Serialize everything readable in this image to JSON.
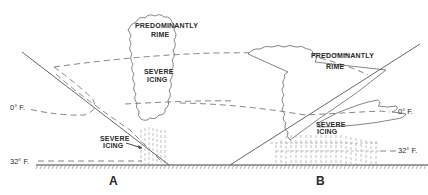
{
  "diagram": {
    "panels": [
      {
        "id": "A",
        "label": "A",
        "cloud_labels": {
          "top": [
            "PREDOMINANTLY",
            "RIME"
          ],
          "middle": [
            "SEVERE",
            "ICING"
          ]
        },
        "ground_label": [
          "SEVERE",
          "ICING"
        ],
        "isotherms": {
          "upper": "0° F.",
          "lower": "32° F."
        }
      },
      {
        "id": "B",
        "label": "B",
        "cloud_labels": {
          "top": [
            "PREDOMINANTLY",
            "RIME"
          ],
          "lower": [
            "SEVERE",
            "ICING"
          ]
        },
        "isotherms": {
          "upper": "0° F.",
          "lower": "32° F."
        }
      }
    ]
  }
}
